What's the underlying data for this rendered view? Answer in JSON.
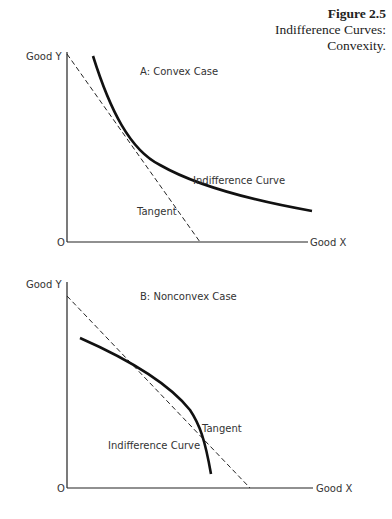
{
  "caption": {
    "figure": "Figure 2.5",
    "line1": "Indifference Curves:",
    "line2": "Convexity."
  },
  "panel_a": {
    "title": "A: Convex Case",
    "y_axis_label": "Good Y",
    "x_axis_label": "Good X",
    "origin_label": "O",
    "curve_label": "Indifference Curve",
    "tangent_label": "Tangent"
  },
  "panel_b": {
    "title": "B: Nonconvex Case",
    "y_axis_label": "Good Y",
    "x_axis_label": "Good X",
    "origin_label": "O",
    "curve_label": "Indifference Curve",
    "tangent_label": "Tangent"
  },
  "colors": {
    "ink": "#111111",
    "text": "#333333",
    "background": "#ffffff"
  }
}
